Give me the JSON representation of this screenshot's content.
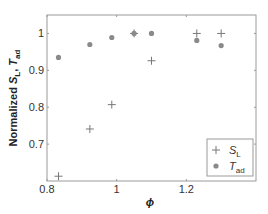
{
  "chart_data": {
    "type": "scatter",
    "title": "",
    "xlabel": "ϕ",
    "ylabel": "Normalized S_L, T_ad",
    "xlim": [
      0.8,
      1.4
    ],
    "ylim": [
      0.6,
      1.05
    ],
    "xticks": [
      0.8,
      1.0,
      1.2
    ],
    "xtick_labels": [
      "0.8",
      "1",
      "1.2"
    ],
    "yticks": [
      0.7,
      0.8,
      0.9,
      1.0
    ],
    "ytick_labels": [
      "0.7",
      "0.8",
      "0.9",
      "1"
    ],
    "grid": false,
    "legend_position": "lower right",
    "series": [
      {
        "name": "S_L",
        "marker": "plus",
        "color": "#777777",
        "x": [
          0.833,
          0.923,
          0.986,
          1.05,
          1.1,
          1.23,
          1.3
        ],
        "y": [
          0.613,
          0.741,
          0.807,
          1.0,
          0.926,
          1.0,
          1.0
        ]
      },
      {
        "name": "T_ad",
        "marker": "circle",
        "color": "#8a8a8a",
        "x": [
          0.833,
          0.923,
          0.986,
          1.05,
          1.1,
          1.23,
          1.3
        ],
        "y": [
          0.935,
          0.97,
          0.989,
          1.0,
          1.0,
          0.981,
          0.967
        ]
      }
    ]
  },
  "labels": {
    "ylabel_main": "Normalized ",
    "ylabel_s": "S",
    "ylabel_s_sub": "L",
    "ylabel_sep": ", ",
    "ylabel_t": "T",
    "ylabel_t_sub": "ad",
    "xlabel": "ϕ",
    "legend_s": "S",
    "legend_s_sub": "L",
    "legend_t": "T",
    "legend_t_sub": "ad"
  }
}
